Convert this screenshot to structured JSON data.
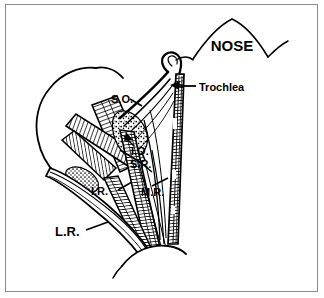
{
  "figure": {
    "style": "black-and-white line drawing",
    "border_color": "#8d8d8d",
    "ink_color": "#000000",
    "background_color": "#ffffff",
    "width": 324,
    "height": 298
  },
  "labels": {
    "nose": "NOSE",
    "trochlea": "Trochlea",
    "superior_oblique": "S.O.",
    "inferior_oblique": "I.O.",
    "superior_rectus": "S.R.",
    "medial_rectus": "M.R.",
    "inferior_rectus": "I.R.",
    "lateral_rectus": "L.R."
  }
}
